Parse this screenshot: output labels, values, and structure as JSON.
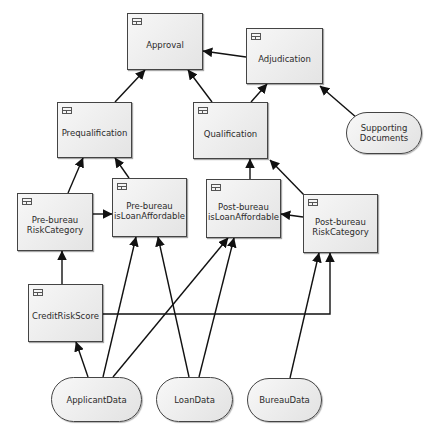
{
  "diagram": {
    "nodes": [
      {
        "id": "approval",
        "label": "Approval",
        "type": "decision",
        "x": 127,
        "y": 13,
        "w": 76,
        "h": 57,
        "icon": "decision-table-icon"
      },
      {
        "id": "adjudication",
        "label": "Adjudication",
        "type": "decision",
        "x": 246,
        "y": 28,
        "w": 77,
        "h": 56,
        "icon": "decision-table-icon"
      },
      {
        "id": "prequalification",
        "label": "Prequalification",
        "type": "decision",
        "x": 57,
        "y": 102,
        "w": 75,
        "h": 56,
        "icon": "decision-table-icon"
      },
      {
        "id": "qualification",
        "label": "Qualification",
        "type": "decision",
        "x": 193,
        "y": 102,
        "w": 75,
        "h": 57,
        "icon": "decision-table-icon"
      },
      {
        "id": "supporting_documents",
        "label": "Supporting\nDocuments",
        "type": "knowledge",
        "x": 346,
        "y": 112,
        "w": 76,
        "h": 42
      },
      {
        "id": "prebureau_riskcategory",
        "label": "Pre-bureau\nRiskCategory",
        "type": "decision",
        "x": 17,
        "y": 193,
        "w": 76,
        "h": 58,
        "icon": "decision-table-icon"
      },
      {
        "id": "prebureau_isloanaffordable",
        "label": "Pre-bureau\nisLoanAffordable",
        "type": "decision",
        "x": 112,
        "y": 178,
        "w": 75,
        "h": 59,
        "icon": "decision-table-icon"
      },
      {
        "id": "postbureau_isloanaffordable",
        "label": "Post-bureau\nisLoanAffordable",
        "type": "decision",
        "x": 206,
        "y": 179,
        "w": 75,
        "h": 59,
        "icon": "decision-table-icon"
      },
      {
        "id": "postbureau_riskcategory",
        "label": "Post-bureau\nRiskCategory",
        "type": "decision",
        "x": 303,
        "y": 194,
        "w": 75,
        "h": 59,
        "icon": "decision-table-icon"
      },
      {
        "id": "creditriskscore",
        "label": "CreditRiskScore",
        "type": "decision",
        "x": 28,
        "y": 284,
        "w": 75,
        "h": 58,
        "icon": "decision-table-icon"
      },
      {
        "id": "applicantdata",
        "label": "ApplicantData",
        "type": "input",
        "x": 51,
        "y": 377,
        "w": 91,
        "h": 45
      },
      {
        "id": "loandata",
        "label": "LoanData",
        "type": "input",
        "x": 156,
        "y": 377,
        "w": 77,
        "h": 45
      },
      {
        "id": "bureaudata",
        "label": "BureauData",
        "type": "input",
        "x": 247,
        "y": 378,
        "w": 75,
        "h": 44
      }
    ],
    "edges": [
      {
        "from": "adjudication",
        "to": "approval",
        "points": [
          [
            246,
            57
          ],
          [
            203,
            51
          ]
        ]
      },
      {
        "from": "prequalification",
        "to": "approval",
        "points": [
          [
            115,
            102
          ],
          [
            145,
            70
          ]
        ]
      },
      {
        "from": "qualification",
        "to": "approval",
        "points": [
          [
            212,
            102
          ],
          [
            188,
            70
          ]
        ]
      },
      {
        "from": "qualification",
        "to": "adjudication",
        "points": [
          [
            251,
            102
          ],
          [
            267,
            84
          ]
        ]
      },
      {
        "from": "supporting_documents",
        "to": "adjudication",
        "points": [
          [
            357,
            118
          ],
          [
            320,
            86
          ]
        ]
      },
      {
        "from": "prebureau_riskcategory",
        "to": "prequalification",
        "points": [
          [
            68,
            193
          ],
          [
            83,
            158
          ]
        ]
      },
      {
        "from": "prebureau_isloanaffordable",
        "to": "prequalification",
        "points": [
          [
            129,
            178
          ],
          [
            115,
            158
          ]
        ]
      },
      {
        "from": "prebureau_riskcategory",
        "to": "prebureau_isloanaffordable",
        "points": [
          [
            93,
            214
          ],
          [
            112,
            214
          ]
        ]
      },
      {
        "from": "postbureau_isloanaffordable",
        "to": "qualification",
        "points": [
          [
            250,
            179
          ],
          [
            250,
            159
          ]
        ]
      },
      {
        "from": "postbureau_riskcategory",
        "to": "qualification",
        "points": [
          [
            305,
            196
          ],
          [
            270,
            160
          ]
        ]
      },
      {
        "from": "postbureau_riskcategory",
        "to": "postbureau_isloanaffordable",
        "points": [
          [
            303,
            217
          ],
          [
            281,
            214
          ]
        ]
      },
      {
        "from": "creditriskscore",
        "to": "prebureau_riskcategory",
        "points": [
          [
            62,
            284
          ],
          [
            62,
            251
          ]
        ]
      },
      {
        "from": "creditriskscore",
        "to": "postbureau_riskcategory",
        "points": [
          [
            103,
            314
          ],
          [
            330,
            314
          ],
          [
            330,
            253
          ]
        ]
      },
      {
        "from": "applicantdata",
        "to": "creditriskscore",
        "points": [
          [
            88,
            377
          ],
          [
            76,
            342
          ]
        ]
      },
      {
        "from": "applicantdata",
        "to": "prebureau_isloanaffordable",
        "points": [
          [
            103,
            377
          ],
          [
            136,
            237
          ]
        ]
      },
      {
        "from": "applicantdata",
        "to": "postbureau_isloanaffordable",
        "points": [
          [
            113,
            377
          ],
          [
            228,
            238
          ]
        ]
      },
      {
        "from": "loandata",
        "to": "prebureau_isloanaffordable",
        "points": [
          [
            189,
            377
          ],
          [
            158,
            237
          ]
        ]
      },
      {
        "from": "loandata",
        "to": "postbureau_isloanaffordable",
        "points": [
          [
            199,
            377
          ],
          [
            234,
            238
          ]
        ]
      },
      {
        "from": "bureaudata",
        "to": "postbureau_riskcategory",
        "points": [
          [
            290,
            378
          ],
          [
            319,
            253
          ]
        ]
      }
    ]
  }
}
